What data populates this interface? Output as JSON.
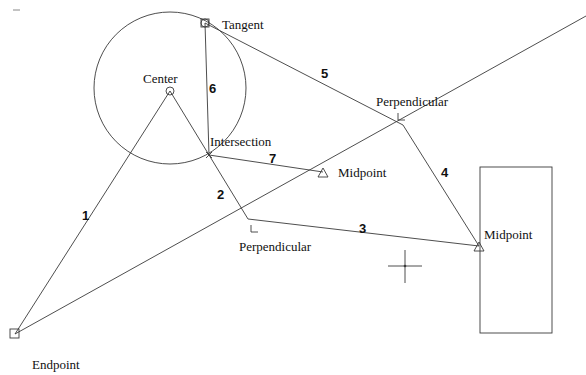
{
  "diagram": {
    "colors": {
      "line": "#3a3a3a",
      "text": "#111111",
      "background": "#ffffff"
    },
    "snap_labels": {
      "tangent": "Tangent",
      "center": "Center",
      "intersection": "Intersection",
      "perpendicular_upper": "Perpendicular",
      "perpendicular_lower": "Perpendicular",
      "midpoint_inner": "Midpoint",
      "midpoint_rect": "Midpoint",
      "endpoint": "Endpoint"
    },
    "segment_numbers": [
      "1",
      "2",
      "3",
      "4",
      "5",
      "6",
      "7"
    ],
    "markers": {
      "tangent": "circle-square-marker",
      "center": "circle-marker",
      "intersection": "x-marker",
      "perpendicular": "right-angle-marker",
      "midpoint": "triangle-marker",
      "endpoint": "square-marker"
    }
  }
}
